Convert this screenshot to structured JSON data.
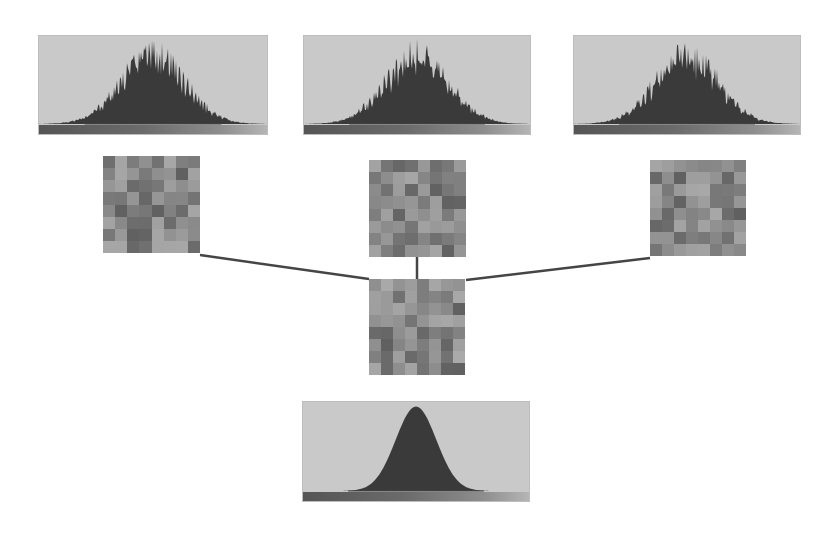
{
  "diagram": {
    "colors": {
      "histogram_bg": "#c9c9c9",
      "histogram_fill": "#3a3a3a",
      "connector": "#454545",
      "background": "#ffffff"
    },
    "top_histograms": [
      {
        "id": "hist-1",
        "x": 38,
        "y": 35,
        "w": 230,
        "h": 100,
        "kind": "noisy"
      },
      {
        "id": "hist-2",
        "x": 303,
        "y": 35,
        "w": 228,
        "h": 100,
        "kind": "noisy"
      },
      {
        "id": "hist-3",
        "x": 573,
        "y": 35,
        "w": 228,
        "h": 100,
        "kind": "noisy"
      }
    ],
    "patches": [
      {
        "id": "patch-left",
        "x": 103,
        "y": 156,
        "size": 97,
        "seed": 3
      },
      {
        "id": "patch-middle",
        "x": 369,
        "y": 160,
        "size": 97,
        "seed": 11
      },
      {
        "id": "patch-right",
        "x": 650,
        "y": 160,
        "size": 96,
        "seed": 23
      },
      {
        "id": "patch-merged",
        "x": 369,
        "y": 279,
        "size": 96,
        "seed": 37
      }
    ],
    "connectors": [
      {
        "from": "patch-left",
        "x1": 200,
        "y1": 255,
        "x2": 369,
        "y2": 279
      },
      {
        "from": "patch-middle",
        "x1": 417,
        "y1": 257,
        "x2": 417,
        "y2": 279
      },
      {
        "from": "patch-right",
        "x1": 650,
        "y1": 258,
        "x2": 466,
        "y2": 280
      }
    ],
    "bottom_histogram": {
      "id": "hist-merged",
      "x": 302,
      "y": 401,
      "w": 228,
      "h": 101,
      "kind": "gaussian"
    }
  }
}
